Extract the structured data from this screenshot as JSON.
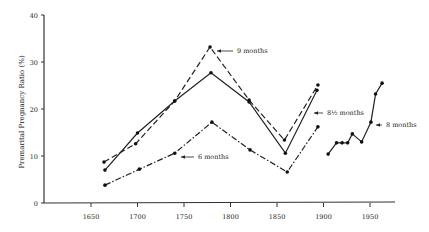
{
  "chart_data": {
    "type": "line",
    "title": "",
    "xlabel": "",
    "ylabel": "Premarital Pregnancy Ratio (%)",
    "xlim": [
      1620,
      1980
    ],
    "ylim": [
      0,
      40
    ],
    "x_ticks": [
      1650,
      1700,
      1750,
      1800,
      1850,
      1900,
      1950
    ],
    "y_ticks": [
      0,
      10,
      20,
      30,
      40
    ],
    "grid": false,
    "legend": "inline annotations with arrows",
    "series": [
      {
        "name": "9 months",
        "style": "dashed",
        "x": [
          1664,
          1698,
          1740,
          1778,
          1820,
          1858,
          1894
        ],
        "y": [
          8.7,
          12.6,
          21.7,
          33.2,
          21.9,
          13.4,
          25.1
        ],
        "label_anchor_index": 3
      },
      {
        "name": "8½ months",
        "style": "solid",
        "x": [
          1665,
          1700,
          1740,
          1779,
          1820,
          1859,
          1893
        ],
        "y": [
          7.0,
          14.9,
          21.7,
          27.7,
          21.5,
          10.6,
          24.0
        ],
        "label_anchor_index": 6
      },
      {
        "name": "6 months",
        "style": "dashdot",
        "x": [
          1665,
          1702,
          1740,
          1780,
          1821,
          1861,
          1894
        ],
        "y": [
          3.8,
          7.2,
          10.6,
          17.2,
          11.3,
          6.6,
          16.2
        ],
        "label_anchor_index": 2
      },
      {
        "name": "8 months",
        "style": "solid",
        "x": [
          1905,
          1914,
          1920,
          1926,
          1931,
          1941,
          1951,
          1956,
          1963
        ],
        "y": [
          10.4,
          12.8,
          12.8,
          12.8,
          14.7,
          13.0,
          17.2,
          23.2,
          25.5
        ],
        "label_anchor_index": 6
      }
    ],
    "annotations": [
      {
        "text": "9 months",
        "x_px": 237,
        "y_px": 53,
        "arrow_to": [
          214,
          47
        ]
      },
      {
        "text": "8½ months",
        "x_px": 327,
        "y_px": 115,
        "arrow_to": [
          311,
          113
        ]
      },
      {
        "text": "6 months",
        "x_px": 198,
        "y_px": 159,
        "arrow_to": [
          178,
          153
        ]
      },
      {
        "text": "8 months",
        "x_px": 386,
        "y_px": 127,
        "arrow_to": [
          373,
          124
        ]
      }
    ]
  }
}
